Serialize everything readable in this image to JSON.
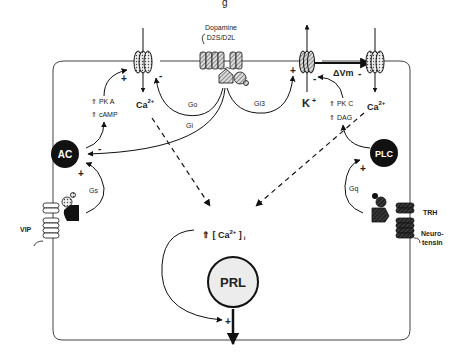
{
  "title_fragment": "g",
  "receptors": {
    "dopamine": {
      "name": "Dopamine",
      "subtypes": "D2S/D2L"
    },
    "vip": {
      "name": "VIP"
    },
    "trh": {
      "name": "TRH"
    },
    "neurotensin": {
      "name": "Neuro-tensin",
      "line1": "Neuro-",
      "line2": "tensin"
    }
  },
  "g_proteins": {
    "go": "Go",
    "gi": "Gi",
    "gi3": "Gi3",
    "gs": "Gs",
    "gq": "Gq"
  },
  "enzymes": {
    "ac": "AC",
    "plc": "PLC"
  },
  "second_messengers": {
    "pka": "⇑ PK A",
    "camp": "⇑ cAMP",
    "pkc": "⇑ PK C",
    "dag": "⇑ DAG"
  },
  "ions": {
    "ca_left": {
      "base": "Ca",
      "sup": "2+"
    },
    "ca_right": {
      "base": "Ca",
      "sup": "2+"
    },
    "k": {
      "base": "K",
      "sup": "+"
    }
  },
  "membrane_potential": "ΔVm",
  "intracellular_ca": {
    "prefix": "⇑ [ Ca",
    "sup": "2+",
    "suffix": " ]",
    "sub": "i"
  },
  "prolactin": "PRL",
  "signs": {
    "plus": "+",
    "minus": "-"
  }
}
